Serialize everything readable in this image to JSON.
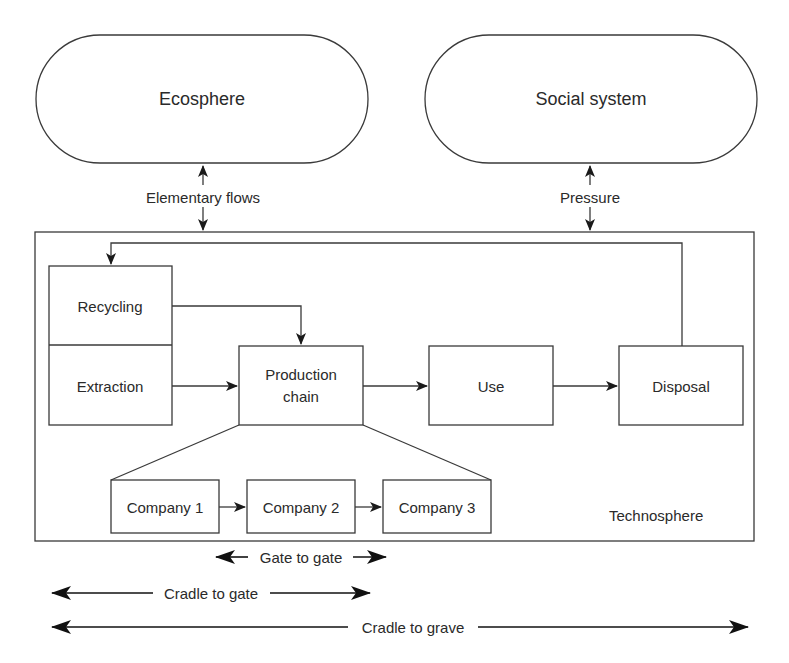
{
  "diagram": {
    "top_systems": [
      {
        "id": "ecosphere",
        "label": "Ecosphere"
      },
      {
        "id": "social",
        "label": "Social system"
      }
    ],
    "interfaces": {
      "elementary_flows": "Elementary flows",
      "pressure": "Pressure"
    },
    "technosphere": {
      "label": "Technosphere",
      "nodes": {
        "recycling": "Recycling",
        "extraction": "Extraction",
        "production_line1": "Production",
        "production_line2": "chain",
        "use": "Use",
        "disposal": "Disposal"
      },
      "companies": [
        "Company 1",
        "Company 2",
        "Company 3"
      ]
    },
    "scopes": {
      "gate_to_gate": "Gate to gate",
      "cradle_to_gate": "Cradle to gate",
      "cradle_to_grave": "Cradle to grave"
    },
    "colors": {
      "line": "#3a3a3a",
      "text": "#2a2a2a",
      "background": "#ffffff"
    }
  }
}
